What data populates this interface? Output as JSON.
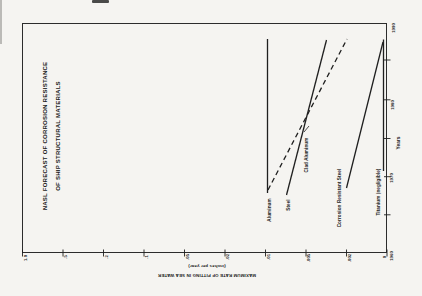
{
  "title": {
    "line1": "NASL FORECAST OF CORROSION RESISTANCE",
    "line2": "OF SHIP STRUCTURAL MATERIALS"
  },
  "axes": {
    "year_axis_label": "Years",
    "rate_axis_label_line1": "MAXIMUM RATE OF PITTING IN SEA WATER",
    "rate_axis_label_line2": "(inches per year)"
  },
  "materials": [
    {
      "label": "Aluminum"
    },
    {
      "label": "Steel"
    },
    {
      "label": "Clad Aluminum"
    },
    {
      "label": "Corrosion Resistant Steel"
    },
    {
      "label": "Titanium (negligible)"
    }
  ],
  "chart_data": {
    "type": "line",
    "title": "NASL FORECAST OF CORROSION RESISTANCE OF SHIP STRUCTURAL MATERIALS",
    "xlabel": "Years",
    "ylabel": "MAXIMUM RATE OF PITTING IN SEA WATER (inches per year)",
    "x_range": [
      1960,
      1990
    ],
    "x_ticks": [
      1960,
      1965,
      1970,
      1975,
      1980,
      1985,
      1990
    ],
    "y_tick_labels": [
      "1.0",
      ".5",
      ".2",
      ".1",
      ".05",
      ".02",
      ".01",
      ".005",
      ".002",
      "0"
    ],
    "orientation_note": "figure printed rotated 90deg CCW on landscape page; year axis vertical at right, rate axis horizontal at bottom decreasing to 0",
    "series": [
      {
        "name": "Aluminum",
        "style": "solid",
        "points": [
          [
            1968,
            0.01
          ],
          [
            1988,
            0.01
          ]
        ]
      },
      {
        "name": "Steel",
        "style": "solid",
        "points": [
          [
            1967.5,
            0.008
          ],
          [
            1988,
            0.003
          ]
        ]
      },
      {
        "name": "Clad Aluminum",
        "style": "dashed",
        "points": [
          [
            1968,
            0.01
          ],
          [
            1988,
            0.002
          ]
        ]
      },
      {
        "name": "Corrosion Resistant Steel",
        "style": "solid",
        "points": [
          [
            1968,
            0.002
          ],
          [
            1987.5,
            0.001
          ]
        ]
      },
      {
        "name": "Titanium",
        "style": "solid",
        "note": "negligible",
        "points": [
          [
            1968,
            0.0
          ],
          [
            1988,
            0.0
          ]
        ]
      }
    ],
    "legend_position": "labels at lower end of each line, rotated"
  },
  "plot": {
    "line_color": "#1f1f1f",
    "lines": [
      {
        "name": "aluminum-line",
        "x1": 267.5,
        "y1": 39,
        "x2": 267.5,
        "y2": 193,
        "w": 1.3
      },
      {
        "name": "steel-line",
        "x1": 286.5,
        "y1": 195,
        "x2": 326.5,
        "y2": 40,
        "w": 1.3
      },
      {
        "name": "clad-aluminum-line",
        "x1": 268,
        "y1": 190,
        "x2": 347,
        "y2": 39,
        "w": 1.3,
        "dash": "5,3.5"
      },
      {
        "name": "clad-aluminum-leader",
        "x1": 304,
        "y1": 132,
        "x2": 309,
        "y2": 126,
        "w": 0.8
      },
      {
        "name": "cres-line",
        "x1": 346.5,
        "y1": 188,
        "x2": 383,
        "y2": 42,
        "w": 1.3
      },
      {
        "name": "titanium-line",
        "x1": 383.5,
        "y1": 39.5,
        "x2": 383.5,
        "y2": 171,
        "w": 1.3
      }
    ],
    "rate_ticks": {
      "xs": [
        22.5,
        63,
        103.5,
        144,
        184.5,
        225,
        265.5,
        306,
        346.5,
        387
      ],
      "y1": 249.5,
      "y2": 256.5
    },
    "year_ticks": {
      "ys": [
        60,
        99.8,
        138.5,
        176.7,
        214.8
      ],
      "x1": 384,
      "x2": 390.5
    },
    "rate_tick_labels": [
      {
        "text": "1.0",
        "x": 24.5,
        "y": 257.5
      },
      {
        "text": ".5",
        "x": 65,
        "y": 256.5
      },
      {
        "text": ".2",
        "x": 105.5,
        "y": 256.5
      },
      {
        "text": ".1",
        "x": 146,
        "y": 256.5
      },
      {
        "text": ".05",
        "x": 186.5,
        "y": 257
      },
      {
        "text": ".02",
        "x": 227,
        "y": 257
      },
      {
        "text": ".01",
        "x": 267.5,
        "y": 257
      },
      {
        "text": ".005",
        "x": 308,
        "y": 257.5
      },
      {
        "text": ".002",
        "x": 348.5,
        "y": 257.5
      },
      {
        "text": "0",
        "x": 383.5,
        "y": 257
      }
    ],
    "year_tick_labels": [
      {
        "text": "1990",
        "x": 392.5,
        "y": 28
      },
      {
        "text": "1980",
        "x": 391.5,
        "y": 105
      },
      {
        "text": "1970",
        "x": 390.5,
        "y": 177.5
      },
      {
        "text": "1960",
        "x": 390.5,
        "y": 256
      }
    ],
    "material_label_pos": [
      {
        "x": 268.5,
        "y": 209.5
      },
      {
        "x": 287.5,
        "y": 204.5
      },
      {
        "x": 305.5,
        "y": 155
      },
      {
        "x": 339,
        "y": 197.5
      },
      {
        "x": 377.5,
        "y": 192
      }
    ]
  }
}
